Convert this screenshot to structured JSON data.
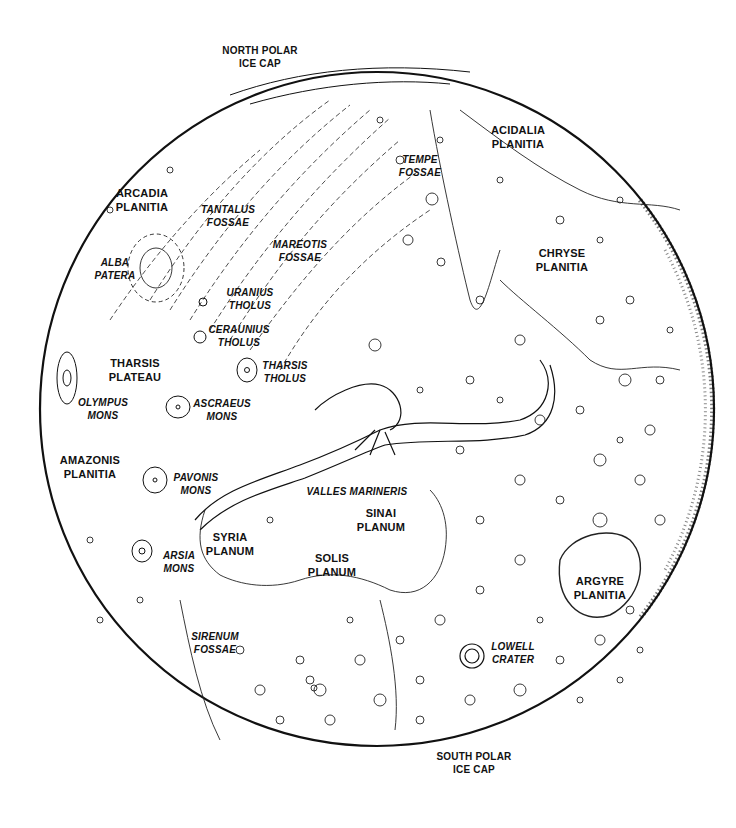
{
  "map": {
    "subject": "Mars",
    "style": "black and white line drawing",
    "colors": {
      "background": "#ffffff",
      "ink": "#111111"
    },
    "globe": {
      "cx": 377,
      "cy": 409,
      "r": 337
    },
    "polar_labels": {
      "north": [
        "NORTH POLAR",
        "ICE CAP"
      ],
      "south": [
        "SOUTH POLAR",
        "ICE CAP"
      ]
    },
    "regions": [
      {
        "id": "acidalia-planitia",
        "lines": [
          "ACIDALIA",
          "PLANITIA"
        ],
        "style": "upright",
        "x": 518,
        "y": 130
      },
      {
        "id": "tempe-fossae",
        "lines": [
          "TEMPE",
          "FOSSAE"
        ],
        "style": "italic",
        "x": 420,
        "y": 160
      },
      {
        "id": "arcadia-planitia",
        "lines": [
          "ARCADIA",
          "PLANITIA"
        ],
        "style": "upright",
        "x": 142,
        "y": 193
      },
      {
        "id": "tantalus-fossae",
        "lines": [
          "TANTALUS",
          "FOSSAE"
        ],
        "style": "italic",
        "x": 228,
        "y": 210
      },
      {
        "id": "mareotis-fossae",
        "lines": [
          "MAREOTIS",
          "FOSSAE"
        ],
        "style": "italic",
        "x": 300,
        "y": 245
      },
      {
        "id": "chryse-planitia",
        "lines": [
          "CHRYSE",
          "PLANITIA"
        ],
        "style": "upright",
        "x": 562,
        "y": 253
      },
      {
        "id": "alba-patera",
        "lines": [
          "ALBA",
          "PATERA"
        ],
        "style": "italic",
        "x": 115,
        "y": 263
      },
      {
        "id": "uranius-tholus",
        "lines": [
          "URANIUS",
          "THOLUS"
        ],
        "style": "italic",
        "x": 250,
        "y": 293
      },
      {
        "id": "ceraunius-tholus",
        "lines": [
          "CERAUNIUS",
          "THOLUS"
        ],
        "style": "italic",
        "x": 239,
        "y": 330
      },
      {
        "id": "tharsis-plateau",
        "lines": [
          "THARSIS",
          "PLATEAU"
        ],
        "style": "upright",
        "x": 135,
        "y": 363
      },
      {
        "id": "tharsis-tholus",
        "lines": [
          "THARSIS",
          "THOLUS"
        ],
        "style": "italic",
        "x": 285,
        "y": 366
      },
      {
        "id": "olympus-mons",
        "lines": [
          "OLYMPUS",
          "MONS"
        ],
        "style": "italic",
        "x": 103,
        "y": 403
      },
      {
        "id": "ascraeus-mons",
        "lines": [
          "ASCRAEUS",
          "MONS"
        ],
        "style": "italic",
        "x": 222,
        "y": 404
      },
      {
        "id": "amazonis-planitia",
        "lines": [
          "AMAZONIS",
          "PLANITIA"
        ],
        "style": "upright",
        "x": 90,
        "y": 460
      },
      {
        "id": "pavonis-mons",
        "lines": [
          "PAVONIS",
          "MONS"
        ],
        "style": "italic",
        "x": 196,
        "y": 478
      },
      {
        "id": "valles-marineris",
        "lines": [
          "VALLES MARINERIS"
        ],
        "style": "italic",
        "x": 357,
        "y": 492
      },
      {
        "id": "sinai-planum",
        "lines": [
          "SINAI",
          "PLANUM"
        ],
        "style": "upright",
        "x": 381,
        "y": 513
      },
      {
        "id": "syria-planum",
        "lines": [
          "SYRIA",
          "PLANUM"
        ],
        "style": "upright",
        "x": 230,
        "y": 537
      },
      {
        "id": "arsia-mons",
        "lines": [
          "ARSIA",
          "MONS"
        ],
        "style": "italic",
        "x": 179,
        "y": 556
      },
      {
        "id": "solis-planum",
        "lines": [
          "SOLIS",
          "PLANUM"
        ],
        "style": "upright",
        "x": 332,
        "y": 558
      },
      {
        "id": "argyre-planitia",
        "lines": [
          "ARGYRE",
          "PLANITIA"
        ],
        "style": "upright",
        "x": 600,
        "y": 581
      },
      {
        "id": "sirenum-fossae",
        "lines": [
          "SIRENUM",
          "FOSSAE"
        ],
        "style": "italic",
        "x": 215,
        "y": 637
      },
      {
        "id": "lowell-crater",
        "lines": [
          "LOWELL",
          "CRATER"
        ],
        "style": "italic",
        "x": 513,
        "y": 647
      }
    ]
  }
}
